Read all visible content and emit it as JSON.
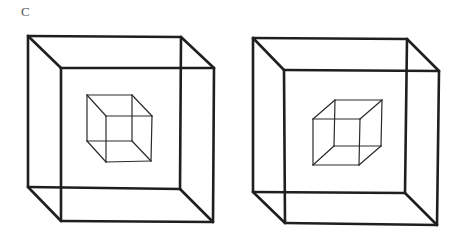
{
  "figure": {
    "panel_label": "C",
    "line_color": "#1f1f1f",
    "background": "#ffffff",
    "cubes": [
      {
        "id": "left-outer",
        "role": "outer-cube",
        "back": [
          [
            28,
            36
          ],
          [
            181,
            37
          ],
          [
            180,
            189
          ],
          [
            28,
            187
          ]
        ],
        "front": [
          [
            61,
            68
          ],
          [
            214,
            68
          ],
          [
            213,
            222
          ],
          [
            61,
            221
          ]
        ]
      },
      {
        "id": "left-inner",
        "role": "inner-cube",
        "orientation": "viewed-from-above-left",
        "back": [
          [
            87,
            95
          ],
          [
            132,
            95
          ],
          [
            132,
            141
          ],
          [
            87,
            141
          ]
        ],
        "front": [
          [
            106,
            116
          ],
          [
            152,
            116
          ],
          [
            151,
            161
          ],
          [
            106,
            162
          ]
        ]
      },
      {
        "id": "right-outer",
        "role": "outer-cube",
        "back": [
          [
            253,
            38
          ],
          [
            407,
            39
          ],
          [
            405,
            193
          ],
          [
            253,
            192
          ]
        ],
        "front": [
          [
            284,
            70
          ],
          [
            439,
            71
          ],
          [
            437,
            225
          ],
          [
            285,
            223
          ]
        ]
      },
      {
        "id": "right-inner",
        "role": "inner-cube",
        "orientation": "viewed-from-below-right",
        "back": [
          [
            335,
            100
          ],
          [
            382,
            100
          ],
          [
            381,
            146
          ],
          [
            334,
            146
          ]
        ],
        "front": [
          [
            313,
            119
          ],
          [
            360,
            119
          ],
          [
            359,
            165
          ],
          [
            313,
            165
          ]
        ]
      }
    ]
  }
}
